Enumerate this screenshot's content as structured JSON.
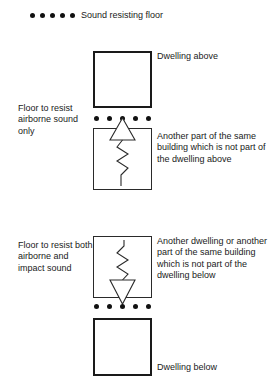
{
  "legend": {
    "dot_count": 5,
    "label": "Sound resisting floor",
    "dot_color": "#111111"
  },
  "blocks": {
    "dwelling_above": {
      "label": "Dwelling above",
      "border": "thick"
    },
    "other_upper": {
      "label": "Another part of the same building which is not part of the dwelling above",
      "border": "thin",
      "sound_symbol": "airborne-sound-upward-triangle-with-zigzag"
    },
    "other_lower": {
      "label": "Another dwelling or another part of the same building which is not part of the dwelling below",
      "border": "thin",
      "sound_symbol": "impact-sound-zigzag-with-downward-triangle"
    },
    "dwelling_below": {
      "label": "Dwelling below",
      "border": "thick"
    }
  },
  "left_annotations": {
    "airborne": "Floor to resist airborne sound only",
    "impact": "Floor to resist both airborne and impact sound"
  },
  "floors": {
    "upper": {
      "name": "sound-resisting-floor-upper",
      "dot_count": 5
    },
    "lower": {
      "name": "sound-resisting-floor-lower",
      "dot_count": 5
    }
  },
  "colors": {
    "ink": "#1a1a1a",
    "dot": "#111111",
    "thin_line": "#2a2a2a",
    "background": "#ffffff"
  }
}
